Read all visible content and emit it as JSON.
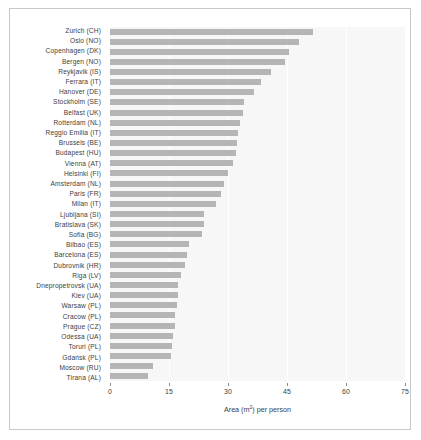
{
  "chart_data": {
    "type": "bar",
    "orientation": "horizontal",
    "title": "",
    "xlabel": "Area (m²) per person",
    "ylabel": "",
    "xlim": [
      0,
      75
    ],
    "xticks": [
      0,
      15,
      30,
      45,
      60,
      75
    ],
    "xtick_labels": [
      "0",
      "15",
      "30",
      "45",
      "60",
      "75"
    ],
    "grid": "vertical",
    "legend": "none",
    "bar_color": "#b5b5b5",
    "plot_background": "#f7f7f7",
    "categories": [
      "Zurich (CH)",
      "Oslo (NO)",
      "Copenhagen (DK)",
      "Bergen (NO)",
      "Reykjavik (IS)",
      "Ferrara (IT)",
      "Hanover (DE)",
      "Stockholm (SE)",
      "Belfast (UK)",
      "Rotterdam (NL)",
      "Reggio Emilia (IT)",
      "Brussels (BE)",
      "Budapest (HU)",
      "Vienna (AT)",
      "Helsinki (FI)",
      "Amsterdam (NL)",
      "Paris (FR)",
      "Milan (IT)",
      "Ljubljana (SI)",
      "Bratislava (SK)",
      "Sofia (BG)",
      "Bilbao (ES)",
      "Barcelona (ES)",
      "Dubrovnik (HR)",
      "Riga (LV)",
      "Dnepropetrovsk (UA)",
      "Kiev (UA)",
      "Warsaw (PL)",
      "Cracow (PL)",
      "Prague (CZ)",
      "Odessa (UA)",
      "Toruri (PL)",
      "Gdańsk (PL)",
      "Moscow (RU)",
      "Tirana (AL)"
    ],
    "values": [
      51.5,
      48.0,
      45.5,
      44.5,
      41.0,
      38.5,
      36.5,
      34.0,
      33.8,
      33.0,
      32.6,
      32.2,
      32.0,
      31.2,
      30.0,
      29.0,
      28.3,
      27.0,
      24.0,
      23.8,
      23.5,
      20.0,
      19.7,
      19.0,
      18.0,
      17.4,
      17.3,
      17.0,
      16.6,
      16.4,
      16.0,
      15.8,
      15.4,
      11.0,
      9.7
    ]
  }
}
